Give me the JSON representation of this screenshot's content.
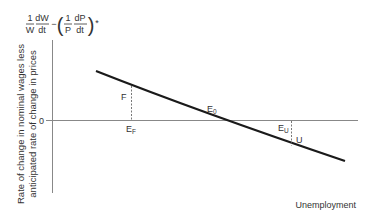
{
  "diagram": {
    "type": "phillips-curve-diagram",
    "y_axis_formula": {
      "frac1_num": "1",
      "frac1_den": "W",
      "frac2_num": "dW",
      "frac2_den": "dt",
      "minus": "−",
      "frac3_num": "1",
      "frac3_den": "P",
      "frac4_num": "dP",
      "frac4_den": "dt",
      "star": "*"
    },
    "y_axis_label_line1": "Rate of change in nominal wages less",
    "y_axis_label_line2": "anticipated rate of change in prices",
    "zero_tick": "0",
    "x_axis_label": "Unemployment",
    "points": {
      "F": "F",
      "E_F": "E",
      "E_F_sub": "F",
      "E_0": "E",
      "E_0_sub": "0",
      "E_U": "E",
      "E_U_sub": "U",
      "U": "U"
    },
    "colors": {
      "axis": "#888888",
      "curve": "#1a1a1a",
      "text": "#333333"
    }
  }
}
